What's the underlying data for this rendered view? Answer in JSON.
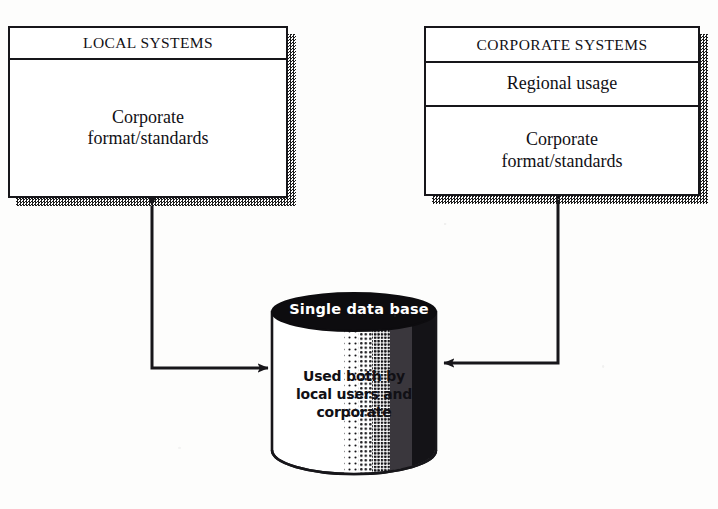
{
  "diagram": {
    "title_semantic": "single-shared-database-architecture",
    "boxes": [
      {
        "name": "local-systems",
        "rows": [
          {
            "label": "LOCAL SYSTEMS",
            "kind": "title"
          },
          {
            "label": "Corporate\nformat/standards",
            "kind": "body"
          }
        ]
      },
      {
        "name": "corporate-systems",
        "rows": [
          {
            "label": "CORPORATE SYSTEMS",
            "kind": "title"
          },
          {
            "label": "Regional usage",
            "kind": "body"
          },
          {
            "label": "Corporate\nformat/standards",
            "kind": "body"
          }
        ]
      }
    ],
    "database": {
      "name": "single-data-base",
      "title": "Single data base",
      "body": "Used both by\nlocal users and\ncorporate"
    },
    "connectors": [
      {
        "name": "local-systems-database-link",
        "from": "single-data-base",
        "to": "local-systems",
        "bidirectional": true
      },
      {
        "name": "corporate-systems-database-link",
        "from": "single-data-base",
        "to": "corporate-systems",
        "bidirectional": true
      }
    ]
  },
  "colors": {
    "ink": "#17161a",
    "paper": "#fdfdfc",
    "shadow": "#1b1b1b",
    "cylinder_cap": "#0d0c0f",
    "cylinder_cap_text": "#ffffff"
  }
}
